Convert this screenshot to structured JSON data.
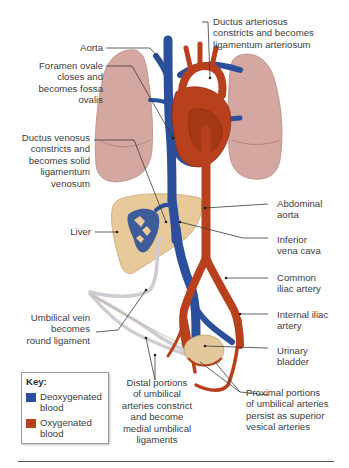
{
  "figure": {
    "colors": {
      "deoxygenated": "#2b4f9a",
      "oxygenated": "#b8401c",
      "lung": "#d4a7a0",
      "liver": "#e8c99a",
      "ligament": "#d9d6dc",
      "leader_line": "#3a3a3a"
    }
  },
  "labels": {
    "aorta": "Aorta",
    "foramen_ovale": "Foramen ovale\ncloses and\nbecomes fossa\novalis",
    "ductus_arteriosus": "Ductus arteriosus\nconstricts and becomes\nligamentum arteriosum",
    "ductus_venosus": "Ductus venosus\nconstricts and\nbecomes solid\nligamentum\nvenosum",
    "liver": "Liver",
    "abdominal_aorta": "Abdominal\naorta",
    "inferior_vena_cava": "Inferior\nvena cava",
    "common_iliac_artery": "Common\niliac artery",
    "umbilical_vein": "Umbilical vein\nbecomes\nround ligament",
    "internal_iliac_artery": "Internal iliac\nartery",
    "urinary_bladder": "Urinary\nbladder",
    "distal_umbilical_arteries": "Distal portions\nof umbilical\narteries constrict\nand become\nmedial umbilical\nligaments",
    "proximal_umbilical_arteries": "Proximal portions\nof umbilical arteries\npersist as superior\nvesical arteries"
  },
  "key": {
    "title": "Key:",
    "items": [
      {
        "label": "Deoxygenated\nblood",
        "color": "#2b4f9a"
      },
      {
        "label": "Oxygenated\nblood",
        "color": "#b8401c"
      }
    ]
  }
}
